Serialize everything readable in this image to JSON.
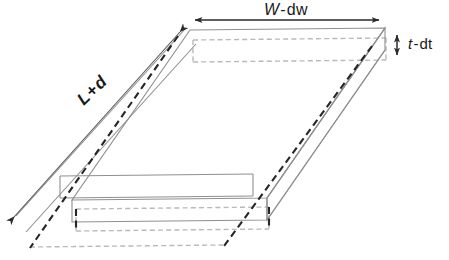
{
  "figure": {
    "type": "3d-technical-drawing",
    "canvas": {
      "width": 449,
      "height": 260,
      "background": "#ffffff"
    },
    "labels": {
      "width": {
        "text": "W - dw",
        "symbol": "W",
        "operator": "-",
        "delta": "dw",
        "name": "width-dimension-label"
      },
      "thickness": {
        "text": "t - dt",
        "symbol": "t",
        "operator": "-",
        "delta": "dt",
        "name": "thickness-dimension-label"
      },
      "length": {
        "text": "L + d",
        "symbol": "L",
        "operator": "+",
        "delta": "d",
        "name": "length-dimension-label",
        "rotation_deg": -44
      }
    },
    "colors": {
      "visible_edge": "#8a8a8a",
      "hidden_edge": "#b5b5b5",
      "dimension_line": "#3a3a3a",
      "hidden_dark_edge": "#2e2e2e",
      "text": "#1a1a1a"
    },
    "geometry": {
      "projection": "oblique",
      "top_face": {
        "far_left": [
          190,
          30
        ],
        "far_right": [
          385,
          28
        ],
        "near_right": [
          267,
          198
        ],
        "near_left": [
          72,
          200
        ]
      },
      "thickness_px": 22,
      "depth_vector": [
        -118,
        170
      ]
    },
    "dimension_lines": {
      "width_arrow": {
        "x1": 193,
        "y1": 20,
        "x2": 381,
        "y2": 20,
        "arrows": "both"
      },
      "thickness_arrow": {
        "x1": 397,
        "y1": 33,
        "x2": 397,
        "y2": 56,
        "arrows": "both"
      },
      "length_arrow": {
        "x1": 182,
        "y1": 30,
        "x2": 12,
        "y2": 218,
        "arrows": "both"
      }
    }
  }
}
